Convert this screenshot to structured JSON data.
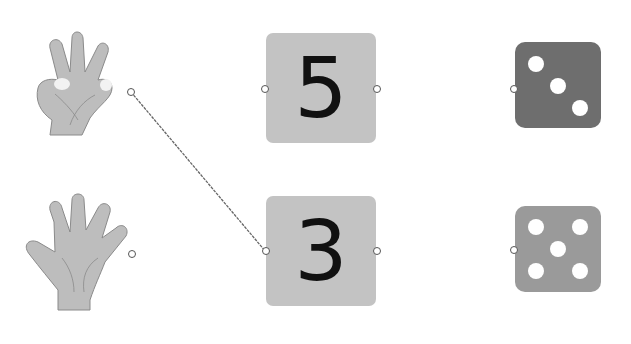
{
  "exercise": {
    "type": "matching",
    "columns": {
      "hands": [
        {
          "id": "hand-three",
          "fingers_shown": 3
        },
        {
          "id": "hand-five",
          "fingers_shown": 5
        }
      ],
      "numbers": [
        {
          "id": "number-five",
          "label": "5"
        },
        {
          "id": "number-three",
          "label": "3"
        }
      ],
      "dice": [
        {
          "id": "die-three",
          "pips": 3,
          "color": "#6e6e6e"
        },
        {
          "id": "die-five",
          "pips": 5,
          "color": "#9a9a9a"
        }
      ]
    },
    "connections": [
      {
        "from": "hand-three",
        "to": "number-three"
      }
    ]
  },
  "colors": {
    "card": "#c3c3c3",
    "hand": "#bdbdbd",
    "line": "#666666"
  }
}
